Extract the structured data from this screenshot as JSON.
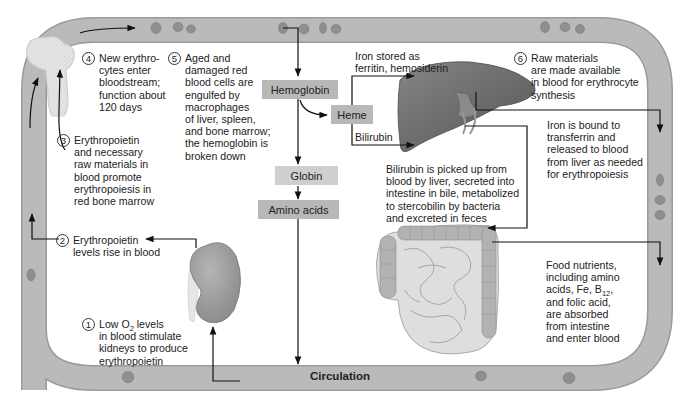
{
  "figure": {
    "vessel_label": "Circulation",
    "colors": {
      "vessel": "#b9b9b9",
      "vessel_edge": "#9a9a9a",
      "red_cell": "#8f8f8f",
      "box_dark": "#b8b8b8",
      "box_light": "#cfcfcf",
      "liver": "#6d6d6d",
      "kidney": "#9c9c9c",
      "intestine": "#d8d8d8",
      "arrow": "#111111"
    }
  },
  "steps": [
    {
      "number": "1",
      "lines": [
        "Low O₂ levels",
        "in blood stimulate",
        "kidneys to produce",
        "erythropoietin"
      ]
    },
    {
      "number": "2",
      "lines": [
        "Erythropoietin",
        "levels rise in blood"
      ]
    },
    {
      "number": "3",
      "lines": [
        "Erythropoietin",
        "and necessary",
        "raw materials in",
        "blood promote",
        "erythropoiesis in",
        "red bone marrow"
      ]
    },
    {
      "number": "4",
      "lines": [
        "New erythro-",
        "cytes enter",
        "bloodstream;",
        "function about",
        "120 days"
      ]
    },
    {
      "number": "5",
      "lines": [
        "Aged and",
        "damaged red",
        "blood cells are",
        "engulfed by",
        "macrophages",
        "of liver, spleen,",
        "and bone marrow;",
        "the hemoglobin is",
        "broken down"
      ]
    },
    {
      "number": "6",
      "lines": [
        "Raw materials",
        "are made available",
        "in blood for erythrocyte",
        "synthesis"
      ]
    }
  ],
  "boxes": {
    "hemoglobin": "Hemoglobin",
    "heme": "Heme",
    "globin": "Globin",
    "amino_acids": "Amino acids"
  },
  "notes": {
    "iron_stored": [
      "Iron stored as",
      "ferritin, hemosiderin"
    ],
    "bilirubin_label": "Bilirubin",
    "bilirubin_text": [
      "Bilirubin is picked up from",
      "blood by liver, secreted into",
      "intestine in bile, metabolized",
      "to stercobilin by bacteria",
      "and excreted in feces"
    ],
    "iron_bound": [
      "Iron is bound to",
      "transferrin and",
      "released to blood",
      "from liver as needed",
      "for erythropoiesis"
    ],
    "food_nutrients": [
      "Food nutrients,",
      "including amino",
      "acids, Fe, B",
      "12",
      ",",
      "and folic acid,",
      "are absorbed",
      "from intestine",
      "and enter blood"
    ]
  }
}
